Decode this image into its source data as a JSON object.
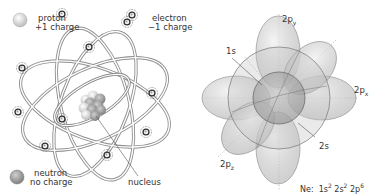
{
  "atom": {
    "legend": {
      "proton": {
        "name": "proton",
        "charge": "+1 charge"
      },
      "electron": {
        "name": "electron",
        "charge": "−1 charge"
      },
      "neutron": {
        "name": "neutron",
        "charge": "no charge"
      }
    },
    "nucleus_label": "nucleus",
    "electron_count": 10
  },
  "orbitals": {
    "labels": {
      "2py": {
        "base": "2p",
        "sub": "y"
      },
      "2px": {
        "base": "2p",
        "sub": "x"
      },
      "2pz": {
        "base": "2p",
        "sub": "z"
      },
      "1s": "1s",
      "2s": "2s"
    },
    "config": {
      "element": "Ne:",
      "terms": [
        {
          "base": "1s",
          "sup": "2"
        },
        {
          "base": "2s",
          "sup": "2"
        },
        {
          "base": "2p",
          "sup": "6"
        }
      ]
    }
  },
  "colors": {
    "orbit": "#8a8a8a",
    "orbit_fill": "#cfcfcf",
    "proton": "#e6e6e6",
    "neutron": "#9a9a9a",
    "lobe": "#bdbdbd",
    "text": "#333333"
  }
}
